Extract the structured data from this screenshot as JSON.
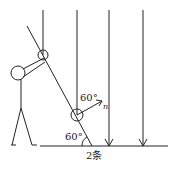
{
  "diagram": {
    "labels": {
      "angle_normal": "60°",
      "angle_ground": "60°",
      "normal_symbol": "n",
      "caption": "2条"
    },
    "colors": {
      "stroke": "#222222",
      "background": "#ffffff"
    }
  }
}
